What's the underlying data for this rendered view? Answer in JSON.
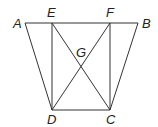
{
  "diagram": {
    "type": "geometry",
    "points": [
      {
        "name": "A",
        "x": 25,
        "y": 23,
        "lx": 13,
        "ly": 28
      },
      {
        "name": "E",
        "x": 52,
        "y": 23,
        "lx": 47,
        "ly": 17
      },
      {
        "name": "F",
        "x": 110,
        "y": 23,
        "lx": 106,
        "ly": 17
      },
      {
        "name": "B",
        "x": 138,
        "y": 23,
        "lx": 142,
        "ly": 28
      },
      {
        "name": "G",
        "x": 81,
        "y": 66,
        "lx": 76,
        "ly": 57
      },
      {
        "name": "D",
        "x": 52,
        "y": 110,
        "lx": 47,
        "ly": 124
      },
      {
        "name": "C",
        "x": 110,
        "y": 110,
        "lx": 106,
        "ly": 124
      }
    ],
    "segments": [
      [
        "A",
        "B"
      ],
      [
        "A",
        "D"
      ],
      [
        "B",
        "C"
      ],
      [
        "D",
        "C"
      ],
      [
        "E",
        "D"
      ],
      [
        "F",
        "C"
      ],
      [
        "E",
        "C"
      ],
      [
        "F",
        "D"
      ]
    ]
  }
}
